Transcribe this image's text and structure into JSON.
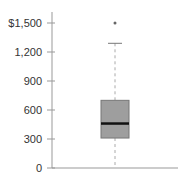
{
  "chart_data": {
    "type": "box",
    "title": "",
    "xlabel": "",
    "ylabel": "",
    "ylim": [
      0,
      1500
    ],
    "y_ticks": [
      0,
      300,
      600,
      900,
      1200,
      1500
    ],
    "y_tick_labels": [
      "0",
      "300",
      "600",
      "900",
      "1,200",
      "$1,500"
    ],
    "grid": false,
    "legend": null,
    "series": [
      {
        "name": "",
        "whisker_low": 0,
        "q1": 310,
        "median": 460,
        "q3": 700,
        "whisker_high": 1290,
        "outliers": [
          1500
        ]
      }
    ]
  },
  "colors": {
    "box_fill": "#9e9e9e",
    "box_stroke": "#777777",
    "median": "#111111",
    "axis": "#999999",
    "whisker": "#aaaaaa",
    "outlier": "#666666"
  }
}
